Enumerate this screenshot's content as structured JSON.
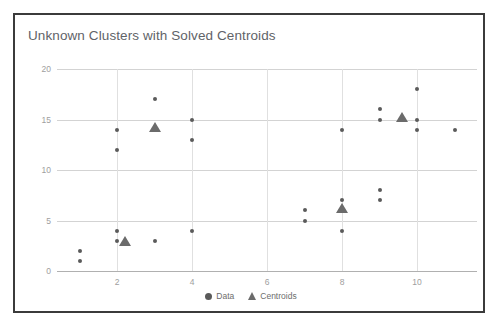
{
  "chart_data": {
    "type": "scatter",
    "title": "Unknown Clusters with Solved Centroids",
    "xlabel": "",
    "ylabel": "",
    "xlim": [
      0.4,
      11.6
    ],
    "ylim": [
      0,
      20
    ],
    "grid": true,
    "legend_position": "bottom-center",
    "xticks": [
      "2",
      "4",
      "6",
      "8",
      "10"
    ],
    "xtick_values": [
      2,
      4,
      6,
      8,
      10
    ],
    "yticks": [
      "0",
      "5",
      "10",
      "15",
      "20"
    ],
    "ytick_values": [
      0,
      5,
      10,
      15,
      20
    ],
    "series": [
      {
        "name": "Data",
        "marker": "circle",
        "color": "#5a5a5a",
        "points": [
          [
            1,
            2
          ],
          [
            1,
            1
          ],
          [
            2,
            14
          ],
          [
            2,
            12
          ],
          [
            2,
            4
          ],
          [
            2,
            3
          ],
          [
            3,
            17
          ],
          [
            3,
            3
          ],
          [
            4,
            15
          ],
          [
            4,
            13
          ],
          [
            4,
            4
          ],
          [
            7,
            6
          ],
          [
            7,
            5
          ],
          [
            8,
            14
          ],
          [
            8,
            7
          ],
          [
            8,
            4
          ],
          [
            9,
            16
          ],
          [
            9,
            15
          ],
          [
            9,
            8
          ],
          [
            9,
            7
          ],
          [
            10,
            18
          ],
          [
            10,
            15
          ],
          [
            10,
            14
          ],
          [
            11,
            14
          ]
        ]
      },
      {
        "name": "Centroids",
        "marker": "triangle",
        "color": "#6b6b6b",
        "points": [
          [
            2.2,
            3.0
          ],
          [
            3.0,
            14.3
          ],
          [
            8.0,
            6.2
          ],
          [
            9.6,
            15.2
          ]
        ]
      }
    ]
  },
  "legend": {
    "items": [
      {
        "label": "Data",
        "marker": "circle"
      },
      {
        "label": "Centroids",
        "marker": "triangle"
      }
    ]
  }
}
